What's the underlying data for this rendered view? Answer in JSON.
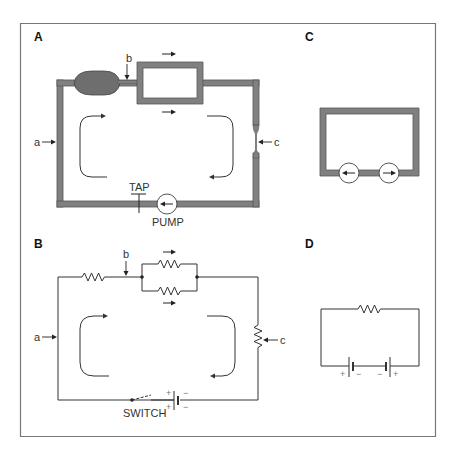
{
  "figure": {
    "panels": {
      "A": {
        "label": "A",
        "description": "Hydraulic circuit analogy",
        "point_labels": {
          "a": "a",
          "b": "b",
          "c": "c"
        },
        "tap_label": "TAP",
        "pump_label": "PUMP"
      },
      "B": {
        "label": "B",
        "description": "Electrical circuit",
        "point_labels": {
          "a": "a",
          "b": "b",
          "c": "c"
        },
        "switch_label": "SWITCH",
        "battery_polarity": {
          "plus": "+",
          "minus": "−"
        }
      },
      "C": {
        "label": "C",
        "description": "Two opposing pumps in a loop"
      },
      "D": {
        "label": "D",
        "description": "Two opposing batteries with resistor",
        "battery_polarity": {
          "plus": "+",
          "minus": "−"
        }
      }
    },
    "colors": {
      "pipe": "#808080",
      "pipe_edge": "#555555",
      "wire": "#333333",
      "frame": "#777777"
    }
  }
}
